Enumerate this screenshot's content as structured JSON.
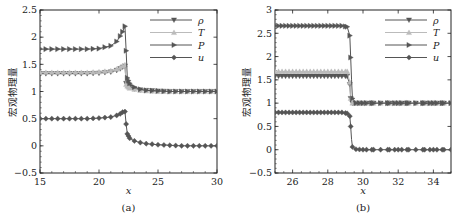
{
  "chart_data": [
    {
      "type": "line",
      "panel_label": "(a)",
      "xlabel": "x",
      "ylabel": "宏观物理量",
      "xlim": [
        15,
        30
      ],
      "ylim": [
        -0.5,
        2.5
      ],
      "xticks": [
        "15",
        "20",
        "25",
        "30"
      ],
      "yticks": [
        "−0.5",
        "0",
        "0.5",
        "1",
        "1.5",
        "2",
        "2.5"
      ],
      "legend_position": "upper right",
      "grid": false,
      "series": [
        {
          "name": "ρ",
          "marker": "triangle-down",
          "color": "#555555",
          "x": [
            15,
            16,
            17,
            18,
            19,
            20,
            21,
            21.5,
            21.8,
            22.0,
            22.2,
            22.3,
            22.4,
            22.6,
            23,
            23.5,
            24,
            25,
            26,
            27,
            28,
            29,
            30
          ],
          "values": [
            1.33,
            1.33,
            1.33,
            1.33,
            1.33,
            1.34,
            1.36,
            1.39,
            1.42,
            1.45,
            1.47,
            1.15,
            1.12,
            1.08,
            1.05,
            1.03,
            1.02,
            1.01,
            1.0,
            1.0,
            1.0,
            1.0,
            1.0
          ]
        },
        {
          "name": "T",
          "marker": "triangle-up",
          "color": "#bbbbbb",
          "x": [
            15,
            16,
            17,
            18,
            19,
            20,
            21,
            21.5,
            21.8,
            22.0,
            22.2,
            22.3,
            22.4,
            22.6,
            23,
            23.5,
            24,
            25,
            26,
            27,
            28,
            29,
            30
          ],
          "values": [
            1.35,
            1.35,
            1.35,
            1.35,
            1.35,
            1.36,
            1.38,
            1.41,
            1.44,
            1.47,
            1.49,
            1.13,
            1.1,
            1.06,
            1.04,
            1.02,
            1.01,
            1.0,
            1.0,
            1.0,
            1.0,
            1.0,
            1.0
          ]
        },
        {
          "name": "P",
          "marker": "triangle-right",
          "color": "#555555",
          "x": [
            15,
            16,
            17,
            18,
            19,
            20,
            21,
            21.5,
            21.8,
            22.0,
            22.2,
            22.3,
            22.4,
            22.6,
            23,
            23.5,
            24,
            25,
            26,
            27,
            28,
            29,
            30
          ],
          "values": [
            1.78,
            1.78,
            1.78,
            1.78,
            1.78,
            1.79,
            1.84,
            1.92,
            2.02,
            2.1,
            2.2,
            1.75,
            1.25,
            1.15,
            1.08,
            1.04,
            1.02,
            1.01,
            1.0,
            1.0,
            1.0,
            1.0,
            1.0
          ]
        },
        {
          "name": "u",
          "marker": "diamond",
          "color": "#555555",
          "x": [
            15,
            16,
            17,
            18,
            19,
            20,
            21,
            21.5,
            21.8,
            22.0,
            22.2,
            22.3,
            22.4,
            22.6,
            23,
            23.5,
            24,
            25,
            26,
            27,
            28,
            29,
            30
          ],
          "values": [
            0.5,
            0.5,
            0.5,
            0.5,
            0.5,
            0.51,
            0.53,
            0.56,
            0.59,
            0.62,
            0.63,
            0.4,
            0.22,
            0.14,
            0.09,
            0.06,
            0.04,
            0.02,
            0.01,
            0.0,
            0.0,
            0.0,
            0.0
          ]
        }
      ]
    },
    {
      "type": "line",
      "panel_label": "(b)",
      "xlabel": "x",
      "ylabel": "宏观物理量",
      "xlim": [
        25,
        35
      ],
      "ylim": [
        -0.5,
        3
      ],
      "xticks": [
        "26",
        "28",
        "30",
        "32",
        "34"
      ],
      "yticks": [
        "−0.5",
        "0",
        "0.5",
        "1",
        "1.5",
        "2",
        "2.5",
        "3"
      ],
      "legend_position": "upper right",
      "grid": false,
      "series": [
        {
          "name": "ρ",
          "marker": "triangle-down",
          "color": "#555555",
          "x": [
            25.2,
            25.6,
            26,
            26.4,
            26.8,
            27.2,
            27.6,
            28,
            28.4,
            28.8,
            29.1,
            29.25,
            29.3,
            29.4,
            29.6,
            30,
            30.5,
            31,
            31.5,
            32,
            32.5,
            33,
            33.5,
            34,
            34.5,
            35
          ],
          "values": [
            1.58,
            1.58,
            1.58,
            1.58,
            1.58,
            1.58,
            1.58,
            1.58,
            1.58,
            1.58,
            1.58,
            1.4,
            1.1,
            1.0,
            1.0,
            1.0,
            1.0,
            1.0,
            1.0,
            1.0,
            1.0,
            1.0,
            1.0,
            1.0,
            1.0,
            1.0
          ]
        },
        {
          "name": "T",
          "marker": "triangle-up",
          "color": "#bbbbbb",
          "x": [
            25.2,
            25.6,
            26,
            26.4,
            26.8,
            27.2,
            27.6,
            28,
            28.4,
            28.8,
            29.1,
            29.25,
            29.3,
            29.4,
            29.6,
            30,
            30.5,
            31,
            31.5,
            32,
            32.5,
            33,
            33.5,
            34,
            34.5,
            35
          ],
          "values": [
            1.68,
            1.68,
            1.68,
            1.68,
            1.68,
            1.68,
            1.68,
            1.68,
            1.68,
            1.68,
            1.68,
            1.45,
            1.1,
            1.0,
            1.0,
            1.0,
            1.0,
            1.0,
            1.0,
            1.0,
            1.0,
            1.0,
            1.0,
            1.0,
            1.0,
            1.0
          ]
        },
        {
          "name": "P",
          "marker": "triangle-right",
          "color": "#555555",
          "x": [
            25.2,
            25.6,
            26,
            26.4,
            26.8,
            27.2,
            27.6,
            28,
            28.4,
            28.8,
            29.1,
            29.25,
            29.3,
            29.35,
            29.4,
            29.6,
            30,
            30.5,
            31,
            31.5,
            32,
            32.5,
            33,
            33.5,
            34,
            34.5,
            35
          ],
          "values": [
            2.66,
            2.66,
            2.66,
            2.66,
            2.66,
            2.66,
            2.66,
            2.66,
            2.66,
            2.66,
            2.64,
            2.45,
            1.98,
            1.5,
            1.1,
            1.0,
            1.0,
            1.0,
            1.0,
            1.0,
            1.0,
            1.0,
            1.0,
            1.0,
            1.0,
            1.0,
            1.0
          ]
        },
        {
          "name": "u",
          "marker": "diamond",
          "color": "#555555",
          "x": [
            25.2,
            25.6,
            26,
            26.4,
            26.8,
            27.2,
            27.6,
            28,
            28.4,
            28.8,
            29.1,
            29.25,
            29.3,
            29.35,
            29.4,
            29.6,
            30,
            30.5,
            31,
            31.5,
            32,
            32.5,
            33,
            33.5,
            34,
            34.5,
            35
          ],
          "values": [
            0.8,
            0.8,
            0.8,
            0.8,
            0.8,
            0.8,
            0.8,
            0.8,
            0.8,
            0.8,
            0.78,
            0.72,
            0.5,
            0.22,
            0.06,
            0.01,
            0.0,
            0.0,
            0.0,
            0.0,
            0.0,
            0.0,
            0.0,
            0.0,
            0.0,
            0.0,
            0.0
          ]
        }
      ]
    }
  ]
}
